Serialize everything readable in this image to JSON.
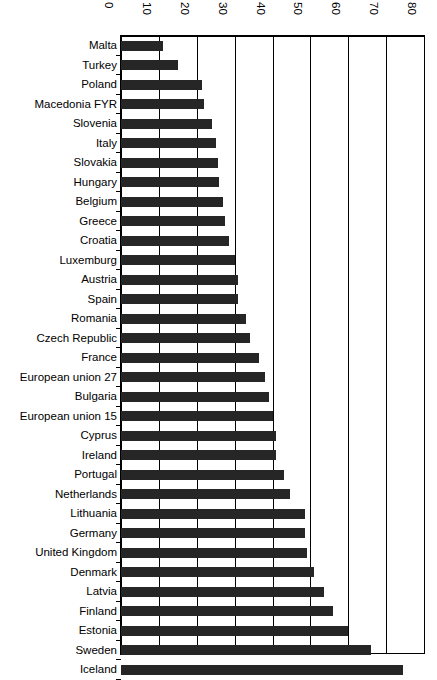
{
  "chart_data": {
    "type": "bar",
    "orientation": "horizontal",
    "title": "",
    "subtitle": "",
    "xlabel": "",
    "ylabel": "",
    "xlim": [
      0,
      80
    ],
    "xticks": [
      0,
      10,
      20,
      30,
      40,
      50,
      60,
      70,
      80
    ],
    "grid": true,
    "legend": null,
    "bar_color": "#262626",
    "axis_color": "#000000",
    "background": "#ffffff",
    "categories": [
      "Malta",
      "Turkey",
      "Poland",
      "Macedonia FYR",
      "Slovenia",
      "Italy",
      "Slovakia",
      "Hungary",
      "Belgium",
      "Greece",
      "Croatia",
      "Luxemburg",
      "Austria",
      "Spain",
      "Romania",
      "Czech Republic",
      "France",
      "European union 27",
      "Bulgaria",
      "European union 15",
      "Cyprus",
      "Ireland",
      "Portugal",
      "Netherlands",
      "Lithuania",
      "Germany",
      "United Kingdom",
      "Denmark",
      "Latvia",
      "Finland",
      "Estonia",
      "Sweden",
      "Iceland"
    ],
    "values": [
      11,
      15,
      21.5,
      22,
      24,
      25,
      25.5,
      26,
      27,
      27.5,
      28.5,
      30,
      31,
      31,
      33,
      34,
      36.5,
      38,
      39,
      40,
      41,
      41,
      43,
      44.5,
      48.5,
      48.5,
      49,
      51,
      53.5,
      56,
      60,
      66,
      74.5
    ]
  },
  "caption": {
    "text": ""
  }
}
